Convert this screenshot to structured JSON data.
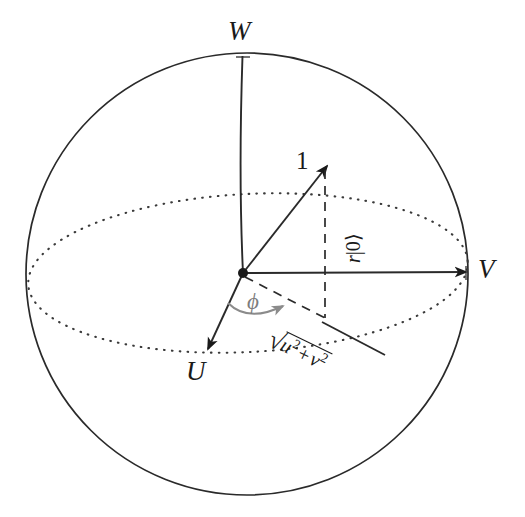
{
  "figure": {
    "type": "bloch-sphere-diagram",
    "background_color": "#ffffff",
    "stroke_color": "#1a1a1a",
    "accent_color": "#7d7d7d"
  },
  "sphere": {
    "center": {
      "x": 247,
      "y": 274
    },
    "radius": 221,
    "outline_style": "solid"
  },
  "equator": {
    "label": "equator-ellipse",
    "rx": 220,
    "ry": 78,
    "rotation_deg": -3,
    "style": "dotted"
  },
  "axes": [
    {
      "name": "w-axis",
      "label": "W",
      "label_x": 228,
      "label_y": 18,
      "description": "vertical axis to north pole"
    },
    {
      "name": "v-axis",
      "label": "V",
      "label_x": 478,
      "label_y": 256,
      "description": "horizontal axis to the right"
    },
    {
      "name": "u-axis",
      "label": "U",
      "label_x": 186,
      "label_y": 358,
      "description": "axis toward lower-left front"
    }
  ],
  "vectors": [
    {
      "name": "state-vector",
      "label": "1",
      "label_x": 296,
      "label_y": 148,
      "description": "solid arrow from origin up-right, magnitude 1"
    },
    {
      "name": "projection-vector",
      "label": "√(u² + v²)",
      "description": "dashed projection in the equatorial plane"
    }
  ],
  "annotations": {
    "vertical_component": {
      "name": "vertical-component-label",
      "prefix": "r",
      "ket": "|0⟩",
      "full": "r|0⟩",
      "rotation_deg": -90,
      "x": 343,
      "y": 263
    },
    "radial_component": {
      "name": "radial-component-label",
      "radical": "√",
      "term_u": "u",
      "term_u_exp": "2",
      "plus": "+",
      "term_v": "v",
      "term_v_exp": "2",
      "full": "√(u² + v²)",
      "rotation_deg": 26,
      "x": 272,
      "y": 328
    },
    "angle": {
      "name": "azimuthal-angle-label",
      "symbol": "ϕ",
      "color": "#7d7d7d",
      "x": 247,
      "y": 290,
      "arc_description": "gray curved arrow from the u-axis toward the projection"
    }
  },
  "origin": {
    "name": "origin-point",
    "x": 243,
    "y": 273,
    "style": "filled-dot"
  }
}
